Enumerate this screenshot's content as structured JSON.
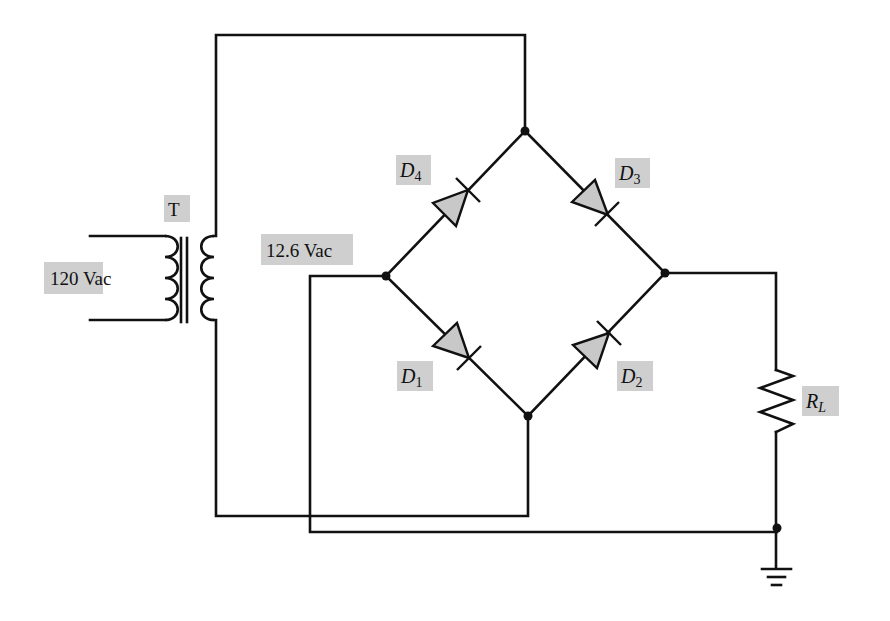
{
  "diagram": {
    "type": "full-wave bridge rectifier circuit",
    "labels": {
      "transformer": "T",
      "primary_voltage": "120 Vac",
      "secondary_voltage": "12.6 Vac",
      "d1": {
        "main": "D",
        "sub": "1"
      },
      "d2": {
        "main": "D",
        "sub": "2"
      },
      "d3": {
        "main": "D",
        "sub": "3"
      },
      "d4": {
        "main": "D",
        "sub": "4"
      },
      "load": {
        "main": "R",
        "sub": "L"
      }
    },
    "components": [
      {
        "id": "T",
        "kind": "transformer"
      },
      {
        "id": "D1",
        "kind": "diode"
      },
      {
        "id": "D2",
        "kind": "diode"
      },
      {
        "id": "D3",
        "kind": "diode"
      },
      {
        "id": "D4",
        "kind": "diode"
      },
      {
        "id": "RL",
        "kind": "resistor"
      },
      {
        "id": "GND",
        "kind": "ground"
      }
    ],
    "colors": {
      "line": "#111111",
      "label_background": "#cfcfcf",
      "diode_fill": "#c8c8c8"
    }
  }
}
